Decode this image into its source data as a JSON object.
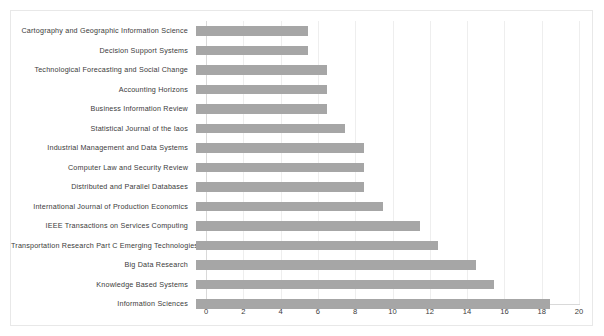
{
  "chart_data": {
    "type": "bar",
    "orientation": "horizontal",
    "title": "",
    "xlabel": "",
    "ylabel": "",
    "xlim": [
      0,
      20
    ],
    "xticks": [
      0,
      2,
      4,
      6,
      8,
      10,
      12,
      14,
      16,
      18,
      20
    ],
    "grid": true,
    "legend": false,
    "bar_color": "#a6a6a6",
    "categories": [
      "Cartography and Geographic Information Science",
      "Decision Support Systems",
      "Technological Forecasting and Social Change",
      "Accounting Horizons",
      "Business Information Review",
      "Statistical Journal of the Iaos",
      "Industrial Management and Data Systems",
      "Computer Law and Security Review",
      "Distributed and Parallel Databases",
      "International Journal of Production Economics",
      "IEEE Transactions on Services Computing",
      "Transportation Research Part C Emerging Technologies",
      "Big Data Research",
      "Knowledge Based Systems",
      "Information Sciences"
    ],
    "values": [
      6,
      6,
      7,
      7,
      7,
      8,
      9,
      9,
      9,
      10,
      12,
      13,
      15,
      16,
      19
    ]
  },
  "axis": {
    "tick_labels": [
      "0",
      "2",
      "4",
      "6",
      "8",
      "10",
      "12",
      "14",
      "16",
      "18",
      "20"
    ]
  },
  "colors": {
    "bar": "#a6a6a6",
    "gridline": "#eeeeee",
    "axis": "#d9d9d9",
    "text": "#3b3b3b",
    "frame_border": "#e8e8e8",
    "background": "#ffffff"
  }
}
